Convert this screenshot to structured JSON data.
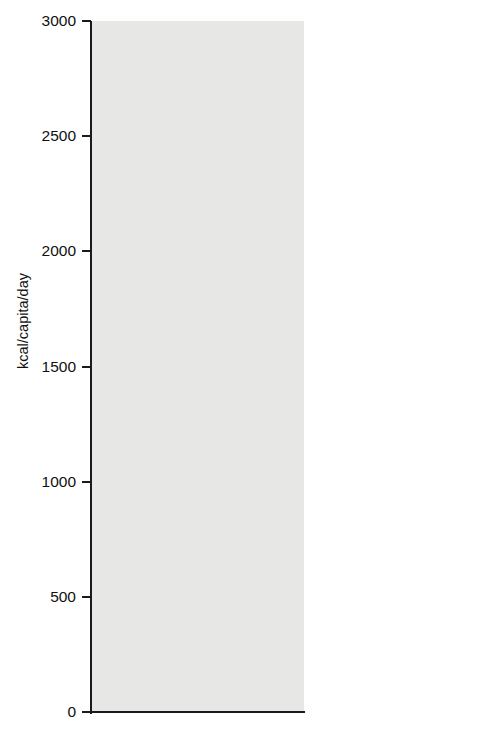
{
  "chart_data": {
    "type": "bar",
    "stacked": true,
    "title": "",
    "xlabel": "",
    "ylabel": "kcal/capita/day",
    "ylim": [
      0,
      3000
    ],
    "yticks": [
      0,
      500,
      1000,
      1500,
      2000,
      2500,
      3000
    ],
    "ytick_labels": [
      "0",
      "500",
      "1000",
      "1500",
      "2000",
      "2500",
      "3000"
    ],
    "grid": false,
    "legend_position": "right",
    "categories": [
      "1964–66",
      "1977–99",
      "2030"
    ],
    "series": [
      {
        "name": "Rice",
        "color": "#77777a",
        "values": [
          955,
          1205,
          1190
        ]
      },
      {
        "name": "Wheat",
        "color": "#6e6e71",
        "values": [
          160,
          148,
          165
        ]
      },
      {
        "name": "Other",
        "color": "#b4b4b2",
        "values": [
          130,
          160,
          196
        ]
      },
      {
        "name": "Vegetables",
        "color": "#9d9d9c",
        "values": [
          122,
          252,
          325
        ]
      },
      {
        "name": "Sugar",
        "color": "#c6c6c4",
        "values": [
          117,
          204,
          282
        ]
      },
      {
        "name": "Meat",
        "color": "#74747a",
        "values": [
          96,
          174,
          226
        ]
      },
      {
        "name": "Root vegetables",
        "color": "#b8b8b5",
        "values": [
          200,
          182,
          152
        ]
      },
      {
        "name": "Pulses",
        "color": "#6d6d72",
        "values": [
          113,
          61,
          61
        ]
      },
      {
        "name": "Other",
        "color": "#3b3b42",
        "values": [
          104,
          195,
          247
        ]
      }
    ],
    "totals": [
      1996,
      2584,
      2844
    ]
  },
  "legend": {
    "items": [
      {
        "label": "Other",
        "color": "#3b3b42"
      },
      {
        "label": "Pulses",
        "color": "#6d6d72"
      },
      {
        "label": "Root vegetables",
        "color": "#b8b8b5"
      },
      {
        "label": "Meat",
        "color": "#74747a"
      },
      {
        "label": "Sugar",
        "color": "#c6c6c4"
      },
      {
        "label": "Vegetables",
        "color": "#9d9d9c"
      },
      {
        "label": "Other",
        "color": "#b4b4b2"
      },
      {
        "label": "Wheat",
        "color": "#6e6e71"
      },
      {
        "label": "Rice",
        "color": "#77777a"
      }
    ]
  },
  "colors": {
    "plot_background": "#e7e7e5",
    "axis": "#1a1a1a",
    "text": "#111111"
  }
}
